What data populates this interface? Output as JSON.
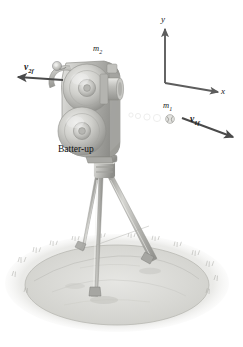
{
  "figure": {
    "kind": "physics-collision-diagram",
    "background_color": "#ffffff",
    "ink_color": "#1a1a1a"
  },
  "labels": {
    "mass_moving": "m",
    "mass_moving_sub": "1",
    "mass_camera": "m",
    "mass_camera_sub": "2",
    "velocity_final_1": "v",
    "velocity_final_1_sub": "1f",
    "velocity_final_2": "v",
    "velocity_final_2_sub": "2f",
    "caption": "Batter-up"
  },
  "axes": {
    "x_label": "x",
    "y_label": "y",
    "origin_note": "corner axes, y up and x right",
    "color": "#5a5a5a"
  },
  "vectors": [
    {
      "name": "v1f",
      "direction": "down-right",
      "label": "v",
      "sub": "1f"
    },
    {
      "name": "v2f",
      "direction": "left",
      "label": "v",
      "sub": "2f"
    }
  ],
  "scene": {
    "ground_color": "#d9d9d7",
    "mound_color": "#cdcdc9",
    "camera_body_color": "#b9b9b6",
    "reel_color": "#c6c6c3",
    "tripod_color": "#b2b2ae"
  }
}
